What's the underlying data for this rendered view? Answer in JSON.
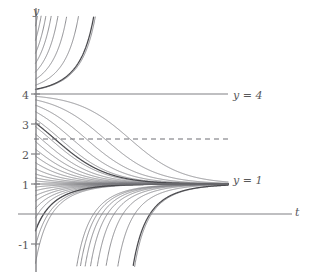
{
  "figure": {
    "width": 313,
    "height": 277,
    "background": "#ffffff",
    "axis_color": "#808084",
    "curve_color": "#7b7b80",
    "curve_color_highlight": "#4a4a4e",
    "text_color": "#59595b"
  },
  "axes": {
    "y_axis_label": "y",
    "t_axis_label": "t",
    "y_ticks": [
      {
        "label": "4",
        "value": 4
      },
      {
        "label": "3",
        "value": 3
      },
      {
        "label": "2",
        "value": 2
      },
      {
        "label": "1",
        "value": 1
      },
      {
        "label": "-1",
        "value": -1
      }
    ],
    "t_ticks": []
  },
  "annotations": [
    {
      "name": "equilibrium-upper",
      "label": "y = 4",
      "value": 4,
      "style": "solid"
    },
    {
      "name": "equilibrium-lower",
      "label": "y = 1",
      "value": 1,
      "style": "solid"
    },
    {
      "name": "inflection-line",
      "label": "",
      "value": 2.5,
      "style": "dashed"
    }
  ],
  "chart_data": {
    "type": "line",
    "title": "",
    "xlabel": "t",
    "ylabel": "y",
    "xlim": [
      -0.3,
      6.6
    ],
    "ylim": [
      -1.6,
      6.4
    ],
    "grid": false,
    "legend": "none",
    "equilibria": [
      {
        "y": 1,
        "label": "y = 1",
        "stability": "stable",
        "line": "solid"
      },
      {
        "y": 4,
        "label": "y = 4",
        "stability": "unstable",
        "line": "solid"
      }
    ],
    "reference_lines": [
      {
        "y": 2.5,
        "label": "",
        "line": "dashed"
      }
    ],
    "initial_conditions_above_4": [
      4.15,
      4.3,
      4.5,
      4.75,
      5.05,
      5.4,
      5.85,
      6.35
    ],
    "initial_conditions_between_1_and_4": [
      3.92,
      3.8,
      3.62,
      3.4,
      3.15,
      2.9,
      2.65,
      2.4,
      2.15,
      1.92,
      1.7,
      1.5,
      1.33,
      1.2,
      1.1
    ],
    "initial_conditions_below_1": [
      0.9,
      0.78,
      0.62,
      0.44,
      0.2,
      -0.1,
      -0.5,
      -1.0,
      -1.55
    ],
    "highlighted_curves": [
      {
        "start_y": 4.15,
        "note": "bold divergent curve above y = 4"
      },
      {
        "start_y": 3.0,
        "note": "bold decaying curve through the dashed line"
      },
      {
        "start_y": -0.5,
        "note": "bold rising curve from below"
      }
    ],
    "tick_values_y": [
      4,
      3,
      2,
      1,
      -1
    ],
    "tick_labels_y": [
      "4",
      "3",
      "2",
      "1",
      "-1"
    ],
    "asymptote_target": 1,
    "curve_right_edge_t": 6.4
  }
}
